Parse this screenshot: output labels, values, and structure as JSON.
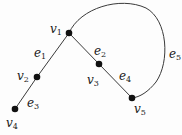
{
  "graph": {
    "vertices": [
      {
        "id": "v1",
        "name": "v",
        "sub": "1",
        "x": 69,
        "y": 33,
        "lx": 50,
        "ly": 23
      },
      {
        "id": "v2",
        "name": "v",
        "sub": "2",
        "x": 37,
        "y": 77,
        "lx": 17,
        "ly": 70
      },
      {
        "id": "v3",
        "name": "v",
        "sub": "3",
        "x": 99,
        "y": 64,
        "lx": 87,
        "ly": 74
      },
      {
        "id": "v4",
        "name": "v",
        "sub": "4",
        "x": 15,
        "y": 109,
        "lx": 6,
        "ly": 117
      },
      {
        "id": "v5",
        "name": "v",
        "sub": "5",
        "x": 132,
        "y": 98,
        "lx": 134,
        "ly": 103
      }
    ],
    "edges": [
      {
        "id": "e1",
        "name": "e",
        "sub": "1",
        "from": "v1",
        "to": "v2",
        "lx": 34,
        "ly": 47
      },
      {
        "id": "e2",
        "name": "e",
        "sub": "2",
        "from": "v1",
        "to": "v3",
        "lx": 94,
        "ly": 45
      },
      {
        "id": "e3",
        "name": "e",
        "sub": "3",
        "from": "v2",
        "to": "v4",
        "lx": 27,
        "ly": 97
      },
      {
        "id": "e4",
        "name": "e",
        "sub": "4",
        "from": "v3",
        "to": "v5",
        "lx": 119,
        "ly": 70
      },
      {
        "id": "e5",
        "name": "e",
        "sub": "5",
        "from": "v1",
        "to": "v5",
        "curved": true,
        "lx": 169,
        "ly": 48
      }
    ],
    "colors": {
      "stroke": "#3a3a3a",
      "vertex": "#111111",
      "text": "#1a1a1a"
    }
  }
}
